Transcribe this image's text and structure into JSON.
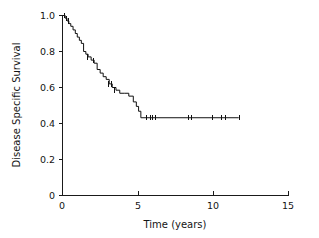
{
  "chart_data": {
    "type": "line",
    "title": "",
    "subtitle": "",
    "xlabel": "Time (years)",
    "ylabel": "Disease Specific Survival",
    "xlim": [
      0,
      15
    ],
    "ylim": [
      0,
      1.0
    ],
    "xticks": [
      0,
      5,
      10,
      15
    ],
    "xticklabels": [
      "0",
      "5",
      "10",
      "15"
    ],
    "yticks": [
      0,
      0.2,
      0.4,
      0.6,
      0.8,
      1.0
    ],
    "yticklabels": [
      "0",
      "0.2",
      "0.4",
      "0.6",
      "0.8",
      "1.0"
    ],
    "grid": false,
    "legend": null,
    "legend_position": "none",
    "curve_style": "step-post",
    "series": [
      {
        "name": "Disease Specific Survival",
        "color": "#111111",
        "x": [
          0.0,
          0.18,
          0.3,
          0.42,
          0.55,
          0.7,
          0.85,
          0.98,
          1.12,
          1.25,
          1.4,
          1.55,
          1.7,
          1.9,
          2.1,
          2.3,
          2.5,
          2.7,
          2.9,
          3.1,
          3.3,
          3.55,
          3.8,
          4.1,
          4.4,
          4.7,
          4.9,
          5.05,
          5.2,
          11.7
        ],
        "y": [
          1.0,
          0.985,
          0.97,
          0.955,
          0.94,
          0.92,
          0.9,
          0.88,
          0.862,
          0.845,
          0.8,
          0.785,
          0.77,
          0.752,
          0.735,
          0.7,
          0.68,
          0.66,
          0.645,
          0.62,
          0.6,
          0.585,
          0.568,
          0.568,
          0.552,
          0.52,
          0.495,
          0.468,
          0.432,
          0.432
        ]
      }
    ],
    "censored": {
      "marker": "vertical-tick",
      "points": [
        {
          "x": 0.1,
          "y": 1.0
        },
        {
          "x": 0.24,
          "y": 0.985
        },
        {
          "x": 0.36,
          "y": 0.97
        },
        {
          "x": 1.62,
          "y": 0.77
        },
        {
          "x": 2.05,
          "y": 0.752
        },
        {
          "x": 3.02,
          "y": 0.62
        },
        {
          "x": 3.22,
          "y": 0.62
        },
        {
          "x": 3.42,
          "y": 0.585
        },
        {
          "x": 5.55,
          "y": 0.432
        },
        {
          "x": 5.8,
          "y": 0.432
        },
        {
          "x": 5.95,
          "y": 0.432
        },
        {
          "x": 6.12,
          "y": 0.432
        },
        {
          "x": 8.35,
          "y": 0.432
        },
        {
          "x": 8.55,
          "y": 0.432
        },
        {
          "x": 9.9,
          "y": 0.432
        },
        {
          "x": 10.55,
          "y": 0.432
        },
        {
          "x": 10.8,
          "y": 0.432
        },
        {
          "x": 11.7,
          "y": 0.432
        }
      ]
    },
    "annotations": []
  },
  "axes": {
    "x_axis_name": "x-axis",
    "y_axis_name": "y-axis"
  }
}
